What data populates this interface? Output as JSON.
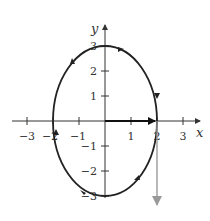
{
  "diagram": {
    "type": "parametric-curve",
    "x_axis_label": "x",
    "y_axis_label": "y",
    "x_ticks": [
      {
        "value": -3,
        "label": "−3"
      },
      {
        "value": -2,
        "label": "−2"
      },
      {
        "value": -1,
        "label": "−1"
      },
      {
        "value": 1,
        "label": "1"
      },
      {
        "value": 2,
        "label": "2"
      },
      {
        "value": 3,
        "label": "3"
      }
    ],
    "y_ticks": [
      {
        "value": 3,
        "label": "3"
      },
      {
        "value": 2,
        "label": "2"
      },
      {
        "value": 1,
        "label": "1"
      },
      {
        "value": -1,
        "label": "−1"
      },
      {
        "value": -2,
        "label": "−2"
      },
      {
        "value": -3,
        "label": "−3"
      }
    ],
    "curve": {
      "center": [
        0,
        0
      ],
      "semi_axis_x": 2,
      "semi_axis_y": 3,
      "direction": "clockwise",
      "color": "#222222"
    },
    "position_vector": {
      "from": [
        0,
        0
      ],
      "to": [
        2,
        0
      ],
      "color": "#111111"
    },
    "velocity_vector": {
      "from": [
        2,
        0
      ],
      "to": [
        2,
        -3.4
      ],
      "color": "#9a9a9a"
    }
  }
}
